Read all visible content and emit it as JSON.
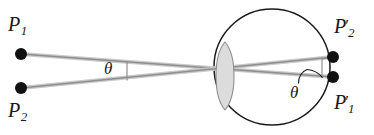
{
  "figure": {
    "type": "ray-diagram",
    "width": 374,
    "height": 135,
    "background_color": "#ffffff",
    "colors": {
      "ray": "#9a9a9a",
      "ray_highlight": "#c8c8c8",
      "outline": "#1a1a1a",
      "lens_fill": "#dcdcdc",
      "lens_stroke": "#8c8c8c",
      "point_fill": "#111111",
      "label_text": "#1a1a1a"
    },
    "object_points": [
      {
        "id": "P1",
        "base": "P",
        "prime": "",
        "subscript": "1",
        "label": "P1",
        "x": 21,
        "y": 54,
        "label_x": 8,
        "label_y": 14,
        "radius": 6
      },
      {
        "id": "P2",
        "base": "P",
        "prime": "",
        "subscript": "2",
        "label": "P2",
        "x": 21,
        "y": 88,
        "label_x": 8,
        "label_y": 100,
        "radius": 6
      }
    ],
    "image_points": [
      {
        "id": "P2p",
        "base": "P",
        "prime": "′",
        "subscript": "2",
        "label": "P2'",
        "x": 333,
        "y": 57,
        "label_x": 334,
        "label_y": 16,
        "radius": 6
      },
      {
        "id": "P1p",
        "base": "P",
        "prime": "′",
        "subscript": "1",
        "label": "P1'",
        "x": 333,
        "y": 77,
        "label_x": 334,
        "label_y": 92,
        "radius": 6
      }
    ],
    "rays": [
      {
        "id": "ray-p1-to-p1prime",
        "from": "P1",
        "to": "P1p",
        "x1": 21,
        "y1": 54,
        "x2": 333,
        "y2": 77
      },
      {
        "id": "ray-p2-to-p2prime",
        "from": "P2",
        "to": "P2p",
        "x1": 21,
        "y1": 88,
        "x2": 333,
        "y2": 57
      }
    ],
    "crossing_point": {
      "x": 225,
      "y": 70
    },
    "lens": {
      "id": "biconvex-lens",
      "center_x": 225,
      "top_y": 42,
      "bottom_y": 110,
      "half_width": 11,
      "fill": "#dcdcdc",
      "stroke": "#8c8c8c"
    },
    "eyeball": {
      "id": "eye-circle",
      "center_x": 272,
      "center_y": 67,
      "radius": 58,
      "stroke": "#1a1a1a",
      "stroke_width": 1.4
    },
    "angles": [
      {
        "id": "theta-left",
        "symbol": "θ",
        "label": "θ",
        "vertex_x": 127,
        "vertex_y": 70,
        "label_x": 104,
        "label_y": 60,
        "marker": "vertical-tick"
      },
      {
        "id": "theta-right",
        "symbol": "θ",
        "label": "θ",
        "vertex_x": 322,
        "vertex_y": 77,
        "label_x": 290,
        "label_y": 84,
        "marker": "arc-with-leader"
      }
    ],
    "angle_bracket_right": {
      "x": 322,
      "top_y": 57,
      "bottom_y": 77
    }
  }
}
